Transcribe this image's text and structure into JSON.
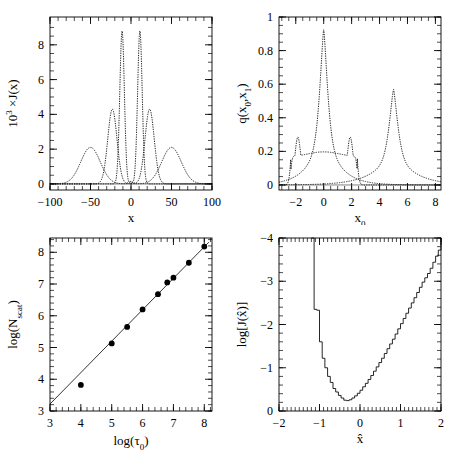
{
  "figure": {
    "panel_count": 4,
    "background": "#ffffff",
    "ink": "#000000"
  },
  "chart_data": [
    {
      "id": "panel-top-left",
      "type": "line",
      "title": "",
      "xlabel": "x",
      "ylabel": "10³ ×J(x)",
      "xlim": [
        -100,
        100
      ],
      "ylim": [
        -0.35,
        9.6
      ],
      "xticks": [
        -100,
        -50,
        0,
        50,
        100
      ],
      "xticklabels": [
        "−100",
        "−50",
        "0",
        "50",
        "100"
      ],
      "yticks": [
        0,
        2,
        4,
        6,
        8
      ],
      "yticklabels": [
        "0",
        "2",
        "4",
        "6",
        "8"
      ],
      "minor_ticks": true,
      "grid": false,
      "legend": "none",
      "series": [
        {
          "name": "narrow",
          "style": "dotted",
          "peaks": [
            -11,
            11
          ],
          "peak_height": 8.8,
          "width": 4.0,
          "trough": 0.15
        },
        {
          "name": "intermediate",
          "style": "dotted",
          "peaks": [
            -23,
            23
          ],
          "peak_height": 4.3,
          "width": 8.0,
          "trough": 0.1
        },
        {
          "name": "broad",
          "style": "dotted",
          "peaks": [
            -50,
            50
          ],
          "peak_height": 2.1,
          "width": 17.0,
          "trough": 0.02
        }
      ]
    },
    {
      "id": "panel-top-right",
      "type": "line",
      "title": "",
      "xlabel": "x₀",
      "ylabel": "q(x₀,x₁)",
      "xlim": [
        -3.2,
        8.4
      ],
      "ylim": [
        -0.03,
        1.0
      ],
      "xticks": [
        -2,
        0,
        2,
        4,
        6,
        8
      ],
      "xticklabels": [
        "−2",
        "0",
        "2",
        "4",
        "6",
        "8"
      ],
      "yticks": [
        0,
        0.2,
        0.4,
        0.6,
        0.8,
        1
      ],
      "yticklabels": [
        "0",
        "0.2",
        "0.4",
        "0.6",
        "0.8",
        "1"
      ],
      "minor_ticks": true,
      "grid": false,
      "legend": "none",
      "series": [
        {
          "name": "central-cusp",
          "style": "dotted",
          "peak_x": 0.0,
          "peak_y": 0.93,
          "core_width": 0.38,
          "wing_width": 1.05
        },
        {
          "name": "flat-top-horns",
          "style": "dotted",
          "horn_x": [
            -1.85,
            1.9
          ],
          "horn_y": 0.285,
          "plateau_y": 0.185,
          "edge_x": [
            -2.35,
            2.4
          ]
        },
        {
          "name": "offset-cusp",
          "style": "dotted",
          "peak_x": 5.0,
          "peak_y": 0.57,
          "core_width": 0.42,
          "wing_width": 1.4
        }
      ]
    },
    {
      "id": "panel-bottom-left",
      "type": "scatter",
      "title": "",
      "xlabel": "log(τ₀)",
      "ylabel": "log(Nₛₑₐₜ)",
      "xlim": [
        3,
        8.25
      ],
      "ylim": [
        3,
        8.45
      ],
      "xticks": [
        3,
        4,
        5,
        6,
        7,
        8
      ],
      "xticklabels": [
        "3",
        "4",
        "5",
        "6",
        "7",
        "8"
      ],
      "yticks": [
        3,
        4,
        5,
        6,
        7,
        8
      ],
      "yticklabels": [
        "3",
        "4",
        "5",
        "6",
        "7",
        "8"
      ],
      "minor_ticks": true,
      "grid": false,
      "legend": "none",
      "points": [
        {
          "x": 4.0,
          "y": 3.82
        },
        {
          "x": 5.0,
          "y": 5.13
        },
        {
          "x": 5.5,
          "y": 5.65
        },
        {
          "x": 6.0,
          "y": 6.2
        },
        {
          "x": 6.5,
          "y": 6.68
        },
        {
          "x": 6.8,
          "y": 7.05
        },
        {
          "x": 7.0,
          "y": 7.2
        },
        {
          "x": 7.5,
          "y": 7.67
        },
        {
          "x": 8.0,
          "y": 8.18
        }
      ],
      "fit_line": {
        "x": [
          3.0,
          8.15
        ],
        "y": [
          3.22,
          8.32
        ],
        "slope": 0.99,
        "intercept": 0.25
      }
    },
    {
      "id": "panel-bottom-right",
      "type": "line",
      "render": "step-histogram",
      "title": "",
      "xlabel": "x̂",
      "ylabel": "log[J(x̂)]",
      "xlim": [
        -2.0,
        2.0
      ],
      "ylim": [
        -4.0,
        0.0
      ],
      "xticks": [
        -2,
        -1,
        0,
        1,
        2
      ],
      "xticklabels": [
        "−2",
        "−1",
        "0",
        "1",
        "2"
      ],
      "yticks": [
        0,
        -1,
        -2,
        -3,
        -4
      ],
      "yticklabels": [
        "0",
        "−1",
        "−2",
        "−3",
        "−4"
      ],
      "minor_ticks": true,
      "grid": false,
      "legend": "none",
      "bin_width": 0.0667,
      "bins_x": [
        -1.2,
        -1.133,
        -1.067,
        -1.0,
        -0.933,
        -0.867,
        -0.8,
        -0.733,
        -0.667,
        -0.6,
        -0.533,
        -0.467,
        -0.4,
        -0.333,
        -0.267,
        -0.2,
        -0.133,
        -0.067,
        0.0,
        0.067,
        0.133,
        0.2,
        0.267,
        0.333,
        0.4,
        0.467,
        0.533,
        0.6,
        0.667,
        0.733,
        0.8,
        0.867,
        0.933,
        1.0,
        1.067,
        1.133,
        1.2,
        1.267,
        1.333,
        1.4,
        1.467,
        1.533,
        1.6,
        1.667,
        1.733,
        1.8,
        1.867,
        1.933,
        2.0
      ],
      "bins_y": [
        -4.0,
        -2.35,
        -2.33,
        -1.6,
        -1.22,
        -1.0,
        -0.8,
        -0.66,
        -0.52,
        -0.44,
        -0.36,
        -0.3,
        -0.25,
        -0.24,
        -0.26,
        -0.3,
        -0.35,
        -0.41,
        -0.48,
        -0.56,
        -0.64,
        -0.73,
        -0.82,
        -0.92,
        -1.02,
        -1.12,
        -1.22,
        -1.33,
        -1.44,
        -1.55,
        -1.66,
        -1.78,
        -1.9,
        -2.02,
        -2.14,
        -2.26,
        -2.38,
        -2.5,
        -2.62,
        -2.74,
        -2.86,
        -2.98,
        -3.08,
        -3.18,
        -3.3,
        -3.44,
        -3.58,
        -3.72,
        -3.86
      ]
    }
  ]
}
